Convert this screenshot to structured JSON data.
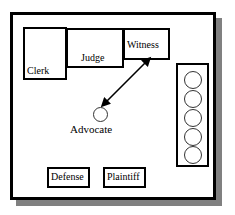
{
  "diagram": {
    "type": "floor-plan",
    "background_color": "#ffffff",
    "frame_color": "#000000",
    "shadow_color": "#808080",
    "stations": [
      {
        "id": "clerk",
        "label": "Clerk",
        "shape": "rectangle"
      },
      {
        "id": "judge",
        "label": "Judge",
        "shape": "rectangle"
      },
      {
        "id": "witness",
        "label": "Witness",
        "shape": "rectangle"
      },
      {
        "id": "defense",
        "label": "Defense",
        "shape": "rectangle"
      },
      {
        "id": "plaintiff",
        "label": "Plaintiff",
        "shape": "rectangle"
      }
    ],
    "advocate": {
      "label": "Advocate",
      "shape": "circle"
    },
    "jury_box": {
      "seat_count": 5,
      "seat_shape": "circle",
      "seat_color": "#ffffff",
      "seat_border_color": "#333333"
    },
    "connection": {
      "from": "advocate",
      "to": "witness",
      "style": "double-headed-arrow",
      "color": "#000000"
    }
  }
}
